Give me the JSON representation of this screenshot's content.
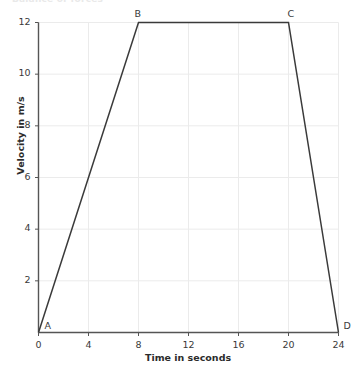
{
  "figure": {
    "clipped_title": "Balance of forces",
    "background_color": "#ffffff",
    "grid_color": "#ebebeb",
    "axis_color": "#555555",
    "line_color": "#3a3a3a"
  },
  "chart_data": {
    "type": "line",
    "title": "",
    "xlabel": "Time in seconds",
    "ylabel": "Velocity in m/s",
    "xlim": [
      0,
      24
    ],
    "ylim": [
      0,
      12
    ],
    "xticks": [
      0,
      4,
      8,
      12,
      16,
      20,
      24
    ],
    "yticks": [
      2,
      4,
      6,
      8,
      10,
      12
    ],
    "xtick_labels": [
      "0",
      "4",
      "8",
      "12",
      "16",
      "20",
      "24"
    ],
    "ytick_labels": [
      "2",
      "4",
      "6",
      "8",
      "10",
      "12"
    ],
    "grid": true,
    "legend": false,
    "series": [
      {
        "name": "velocity",
        "x": [
          0,
          8,
          20,
          24
        ],
        "y": [
          0,
          12,
          12,
          0
        ],
        "point_labels": [
          "A",
          "B",
          "C",
          "D"
        ]
      }
    ],
    "annotations": [
      {
        "text": "A",
        "x": 0,
        "y": 0,
        "dx": 6,
        "dy": -13
      },
      {
        "text": "B",
        "x": 8,
        "y": 12,
        "dx": -4,
        "dy": -15
      },
      {
        "text": "C",
        "x": 20,
        "y": 12,
        "dx": -1,
        "dy": -15
      },
      {
        "text": "D",
        "x": 24,
        "y": 0,
        "dx": 5,
        "dy": -13
      }
    ]
  }
}
